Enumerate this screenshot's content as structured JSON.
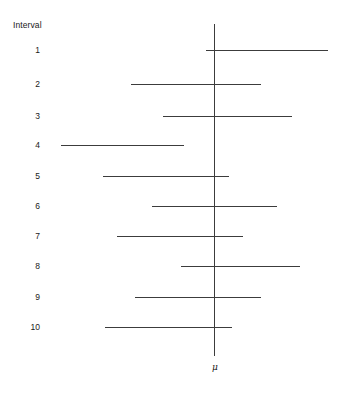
{
  "chart_data": {
    "type": "bar",
    "orientation": "horizontal",
    "title": "",
    "subtitle": "",
    "xlabel": "",
    "ylabel": "Interval",
    "axis_title": "Interval",
    "center_label": "μ",
    "center_value": 0,
    "grid": false,
    "legend": null,
    "xlim": [
      -4.2,
      3.9
    ],
    "categories": [
      "1",
      "2",
      "3",
      "4",
      "5",
      "6",
      "7",
      "8",
      "9",
      "10"
    ],
    "intervals": [
      {
        "label": "1",
        "lower": -0.27,
        "upper": 3.88,
        "contains_mu": true,
        "px_left": 206,
        "px_right": 328,
        "px_y": 50
      },
      {
        "label": "2",
        "lower": -2.82,
        "upper": 1.6,
        "contains_mu": true,
        "px_left": 131,
        "px_right": 261,
        "px_y": 84
      },
      {
        "label": "3",
        "lower": -1.73,
        "upper": 2.65,
        "contains_mu": true,
        "px_left": 163,
        "px_right": 292,
        "px_y": 116
      },
      {
        "label": "4",
        "lower": -5.2,
        "upper": -1.02,
        "contains_mu": false,
        "px_left": 61,
        "px_right": 184,
        "px_y": 145
      },
      {
        "label": "5",
        "lower": -3.77,
        "upper": 0.51,
        "contains_mu": true,
        "px_left": 103,
        "px_right": 229,
        "px_y": 176
      },
      {
        "label": "6",
        "lower": -2.11,
        "upper": 2.14,
        "contains_mu": true,
        "px_left": 152,
        "px_right": 277,
        "px_y": 206
      },
      {
        "label": "7",
        "lower": -3.3,
        "upper": 0.99,
        "contains_mu": true,
        "px_left": 117,
        "px_right": 243,
        "px_y": 236
      },
      {
        "label": "8",
        "lower": -1.12,
        "upper": 2.92,
        "contains_mu": true,
        "px_left": 181,
        "px_right": 300,
        "px_y": 266
      },
      {
        "label": "9",
        "lower": -2.68,
        "upper": 1.6,
        "contains_mu": true,
        "px_left": 135,
        "px_right": 261,
        "px_y": 297
      },
      {
        "label": "10",
        "lower": -3.71,
        "upper": 0.61,
        "contains_mu": true,
        "px_left": 105,
        "px_right": 232,
        "px_y": 327
      }
    ],
    "mu_line": {
      "px_x": 214,
      "px_top": 24,
      "px_bottom": 356,
      "px_label_y": 362
    }
  },
  "colors": {
    "line": "#3c3c3c",
    "text": "#1a1a1a",
    "background": "#ffffff"
  }
}
